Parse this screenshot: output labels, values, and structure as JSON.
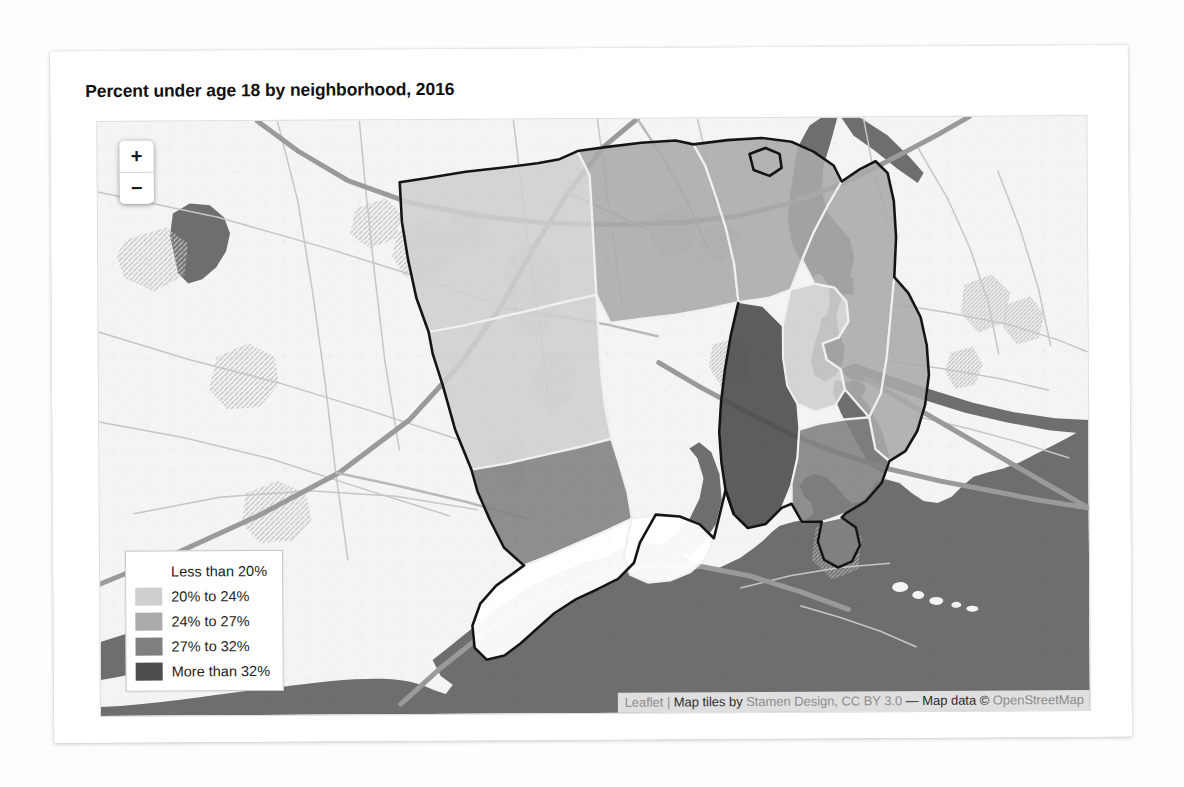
{
  "page": {
    "title": "Percent under age 18 by neighborhood, 2016"
  },
  "map": {
    "zoom_control": {
      "zoom_in_label": "+",
      "zoom_out_label": "−"
    },
    "legend": {
      "items": [
        {
          "label": "Less than 20%",
          "color": "#ffffff"
        },
        {
          "label": "20% to 24%",
          "color": "#cfcfcf"
        },
        {
          "label": "24% to 27%",
          "color": "#aaaaaa"
        },
        {
          "label": "27% to 32%",
          "color": "#7f7f7f"
        },
        {
          "label": "More than 32%",
          "color": "#4d4d4d"
        }
      ]
    },
    "attribution": {
      "leaflet": "Leaflet",
      "pipe": " | ",
      "tiles_by": "Map tiles by ",
      "stamen": "Stamen Design, CC BY 3.0",
      "dash": " — ",
      "map_data": "Map data ",
      "copyright": "© ",
      "osm": "OpenStreetMap",
      "full_text": "Leaflet | Map tiles by Stamen Design, CC BY 3.0 — Map data © OpenStreetMap"
    },
    "basemap_colors": {
      "land": "#f4f4f2",
      "water": "#6e6e6e",
      "road_major": "#8c8c8c",
      "road_minor": "#bdbdbd",
      "park_hatch": "#c9c9c9",
      "boundary": "#141414",
      "neighborhood_divider": "#f0f0f0"
    },
    "choropleth": {
      "title": "Percent under age 18 by neighborhood, 2016",
      "type": "choropleth",
      "breaks": [
        "Less than 20%",
        "20% to 24%",
        "24% to 27%",
        "27% to 32%",
        "More than 32%"
      ],
      "bin_colors": [
        "#ffffff",
        "#cfcfcf",
        "#aaaaaa",
        "#7f7f7f",
        "#4d4d4d"
      ],
      "regions": [
        {
          "id": "nw-upper",
          "bin": 1
        },
        {
          "id": "nw-lower",
          "bin": 1
        },
        {
          "id": "n-center",
          "bin": 2
        },
        {
          "id": "ne-upper",
          "bin": 2
        },
        {
          "id": "ne-inner",
          "bin": 1
        },
        {
          "id": "ne-east",
          "bin": 2
        },
        {
          "id": "central-core",
          "bin": 4
        },
        {
          "id": "central-east",
          "bin": 2
        },
        {
          "id": "e-shore",
          "bin": 3
        },
        {
          "id": "sw-mid",
          "bin": 3
        },
        {
          "id": "sw-coast",
          "bin": 0
        },
        {
          "id": "s-point",
          "bin": 0
        },
        {
          "id": "e-point",
          "bin": 3
        }
      ]
    }
  }
}
